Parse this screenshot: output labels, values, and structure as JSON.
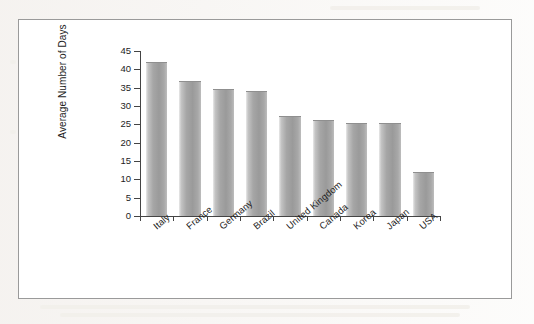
{
  "figure": {
    "frame_border_color": "#9a9a9a",
    "bar_color": "#a6a6a6"
  },
  "chart_data": {
    "type": "bar",
    "title": "",
    "xlabel": "",
    "ylabel": "Average Number of Days",
    "categories": [
      "Italy",
      "France",
      "Germany",
      "Brazil",
      "United Kingdom",
      "Canada",
      "Korea",
      "Japan",
      "USA"
    ],
    "values": [
      42,
      36.7,
      34.6,
      34,
      27.3,
      26.2,
      25.4,
      25.4,
      12
    ],
    "ylim": [
      0,
      45
    ],
    "ytick_labels": [
      "0",
      "5",
      "10",
      "15",
      "20",
      "25",
      "30",
      "35",
      "40",
      "45"
    ],
    "ytick_values": [
      0,
      5,
      10,
      15,
      20,
      25,
      30,
      35,
      40,
      45
    ],
    "grid": false,
    "legend": null,
    "legend_position": "none",
    "series": [
      {
        "name": "Average Number of Days",
        "values": [
          42,
          36.7,
          34.6,
          34,
          27.3,
          26.2,
          25.4,
          25.4,
          12
        ]
      }
    ]
  }
}
